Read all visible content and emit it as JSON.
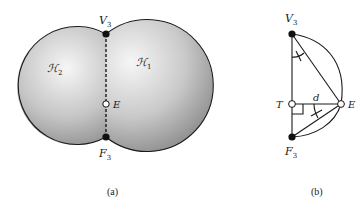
{
  "figure": {
    "panel_a": {
      "caption": "(a)",
      "regions": [
        {
          "id": "H1",
          "label_main": "ℋ",
          "label_sub": "1"
        },
        {
          "id": "H2",
          "label_main": "ℋ",
          "label_sub": "2"
        }
      ],
      "points": {
        "V3": {
          "main": "V",
          "sub": "3",
          "style": "filled"
        },
        "F3": {
          "main": "F",
          "sub": "3",
          "style": "filled"
        },
        "E": {
          "main": "E",
          "style": "hollow"
        }
      },
      "divider": "dashed"
    },
    "panel_b": {
      "caption": "(b)",
      "points": {
        "V3": {
          "main": "V",
          "sub": "3",
          "style": "filled"
        },
        "F3": {
          "main": "F",
          "sub": "3",
          "style": "filled"
        },
        "T": {
          "main": "T",
          "style": "hollow"
        },
        "E": {
          "main": "E",
          "style": "hollow"
        }
      },
      "distance_label": "d"
    },
    "colors": {
      "shade_light": "#f4f4f4",
      "shade_dark": "#8c8c8c",
      "stroke": "#1a1a1a"
    }
  }
}
